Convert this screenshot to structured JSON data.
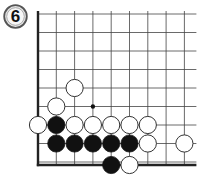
{
  "diagram": {
    "number_label": "6",
    "grid": {
      "cols": 9,
      "rows": 9,
      "origin_x": 38,
      "origin_y": 14,
      "spacing_x": 18.3,
      "spacing_y": 18.5,
      "right_extension": 12,
      "top_extension": 0,
      "line_color": "#444444",
      "edge_color": "#222222",
      "left_edge": true,
      "bottom_edge": true
    },
    "stone_radius": 8.6,
    "colors": {
      "black": "#111111",
      "white_fill": "#ffffff",
      "white_stroke": "#333333",
      "badge_fill": "#e6e6e6",
      "badge_stroke": "#555555"
    },
    "stones": [
      {
        "color": "white",
        "col": 2,
        "row": 4
      },
      {
        "color": "white",
        "col": 1,
        "row": 5
      },
      {
        "color": "white",
        "col": 0,
        "row": 6
      },
      {
        "color": "black",
        "col": 1,
        "row": 6
      },
      {
        "color": "white",
        "col": 2,
        "row": 6
      },
      {
        "color": "white",
        "col": 3,
        "row": 6
      },
      {
        "color": "white",
        "col": 4,
        "row": 6
      },
      {
        "color": "white",
        "col": 5,
        "row": 6
      },
      {
        "color": "white",
        "col": 6,
        "row": 6
      },
      {
        "color": "black",
        "col": 1,
        "row": 7
      },
      {
        "color": "black",
        "col": 2,
        "row": 7
      },
      {
        "color": "black",
        "col": 3,
        "row": 7
      },
      {
        "color": "black",
        "col": 4,
        "row": 7
      },
      {
        "color": "black",
        "col": 5,
        "row": 7
      },
      {
        "color": "white",
        "col": 6,
        "row": 7
      },
      {
        "color": "white",
        "col": 8,
        "row": 7
      },
      {
        "color": "black",
        "col": 4,
        "row": 8
      },
      {
        "color": "white",
        "col": 5,
        "row": 8
      }
    ],
    "markers": [
      {
        "type": "dot",
        "col": 3,
        "row": 5
      }
    ]
  }
}
